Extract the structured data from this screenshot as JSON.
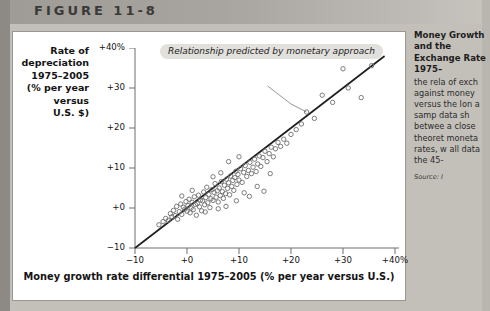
{
  "figure": {
    "label": "FIGURE 11-8"
  },
  "chart_data": {
    "type": "scatter",
    "title": "",
    "xlabel": "Money growth rate differential 1975–2005 (% per year versus U.S.)",
    "ylabel": "Rate of depreciation 1975–2005 (% per year versus U.S. $)",
    "xlim": [
      -10,
      40
    ],
    "ylim": [
      -10,
      40
    ],
    "xticks": [
      "-10",
      "+0",
      "+10",
      "+20",
      "+30",
      "+40%"
    ],
    "yticks": [
      "+40%",
      "+30",
      "+20",
      "+10",
      "+0",
      "-10"
    ],
    "xtick_values": [
      -10,
      0,
      10,
      20,
      30,
      40
    ],
    "ytick_values": [
      40,
      30,
      20,
      10,
      0,
      -10
    ],
    "grid": false,
    "legend": "none",
    "annotation": {
      "text": "Relationship predicted by monetary approach",
      "points_to_x": 23.0,
      "points_to_y": 24.0
    },
    "reference_line": {
      "name": "45-degree line",
      "slope": 1,
      "intercept": 0,
      "from": [
        -10,
        -10
      ],
      "to": [
        38,
        38
      ]
    },
    "marker": {
      "shape": "open-circle",
      "size": 4,
      "color": "#6e6e6e"
    },
    "points": [
      [
        -5.4,
        -4.2
      ],
      [
        -4.6,
        -3.4
      ],
      [
        -4.1,
        -2.6
      ],
      [
        -3.6,
        -3.1
      ],
      [
        -3.2,
        -1.4
      ],
      [
        -2.9,
        -2.2
      ],
      [
        -2.6,
        -0.6
      ],
      [
        -2.3,
        -1.9
      ],
      [
        -2.0,
        0.4
      ],
      [
        -1.8,
        -2.8
      ],
      [
        -1.5,
        -0.9
      ],
      [
        -1.2,
        1.0
      ],
      [
        -1.0,
        -1.6
      ],
      [
        -0.7,
        0.2
      ],
      [
        -0.4,
        -0.3
      ],
      [
        -0.2,
        1.6
      ],
      [
        0.0,
        -0.8
      ],
      [
        0.2,
        0.6
      ],
      [
        0.4,
        2.2
      ],
      [
        0.6,
        -1.2
      ],
      [
        0.8,
        0.0
      ],
      [
        1.0,
        1.4
      ],
      [
        1.2,
        -0.4
      ],
      [
        1.4,
        2.8
      ],
      [
        1.6,
        0.9
      ],
      [
        1.8,
        -1.8
      ],
      [
        2.0,
        1.1
      ],
      [
        2.2,
        3.2
      ],
      [
        2.4,
        0.3
      ],
      [
        2.6,
        2.0
      ],
      [
        2.8,
        -0.7
      ],
      [
        3.0,
        1.8
      ],
      [
        3.2,
        4.0
      ],
      [
        3.4,
        0.8
      ],
      [
        3.6,
        2.6
      ],
      [
        3.8,
        5.2
      ],
      [
        4.0,
        1.3
      ],
      [
        4.2,
        3.4
      ],
      [
        4.4,
        0.1
      ],
      [
        4.6,
        2.3
      ],
      [
        4.8,
        4.6
      ],
      [
        5.0,
        1.9
      ],
      [
        5.2,
        3.9
      ],
      [
        5.4,
        6.1
      ],
      [
        5.6,
        2.7
      ],
      [
        5.8,
        4.3
      ],
      [
        6.0,
        1.5
      ],
      [
        6.2,
        5.0
      ],
      [
        6.4,
        3.1
      ],
      [
        6.6,
        6.6
      ],
      [
        6.8,
        4.1
      ],
      [
        7.0,
        2.4
      ],
      [
        7.2,
        5.7
      ],
      [
        7.4,
        3.6
      ],
      [
        7.6,
        7.2
      ],
      [
        7.8,
        4.9
      ],
      [
        8.0,
        6.3
      ],
      [
        8.2,
        3.3
      ],
      [
        8.4,
        8.0
      ],
      [
        8.6,
        5.4
      ],
      [
        8.8,
        6.9
      ],
      [
        9.0,
        4.4
      ],
      [
        9.2,
        7.6
      ],
      [
        9.4,
        9.2
      ],
      [
        9.6,
        5.9
      ],
      [
        9.8,
        8.4
      ],
      [
        10.0,
        7.0
      ],
      [
        10.3,
        9.8
      ],
      [
        10.6,
        6.4
      ],
      [
        10.9,
        8.9
      ],
      [
        11.2,
        10.6
      ],
      [
        11.5,
        7.9
      ],
      [
        11.8,
        9.4
      ],
      [
        12.1,
        11.4
      ],
      [
        12.4,
        8.6
      ],
      [
        12.7,
        10.2
      ],
      [
        13.0,
        12.2
      ],
      [
        13.3,
        9.1
      ],
      [
        13.6,
        11.0
      ],
      [
        13.9,
        13.0
      ],
      [
        14.2,
        10.4
      ],
      [
        14.6,
        12.6
      ],
      [
        15.0,
        14.2
      ],
      [
        15.4,
        11.6
      ],
      [
        15.8,
        13.6
      ],
      [
        16.2,
        15.2
      ],
      [
        16.6,
        12.8
      ],
      [
        17.0,
        14.8
      ],
      [
        17.5,
        16.4
      ],
      [
        18.0,
        15.4
      ],
      [
        18.6,
        17.2
      ],
      [
        19.2,
        16.2
      ],
      [
        20.0,
        18.4
      ],
      [
        21.0,
        19.6
      ],
      [
        22.0,
        21.0
      ],
      [
        23.0,
        24.0
      ],
      [
        24.5,
        22.4
      ],
      [
        26.0,
        28.2
      ],
      [
        28.0,
        26.4
      ],
      [
        30.0,
        34.8
      ],
      [
        31.0,
        30.0
      ],
      [
        33.5,
        27.6
      ],
      [
        35.5,
        35.6
      ],
      [
        3.5,
        -1.0
      ],
      [
        6.0,
        -0.2
      ],
      [
        7.5,
        0.4
      ],
      [
        9.5,
        1.8
      ],
      [
        12.0,
        2.9
      ],
      [
        14.8,
        4.2
      ],
      [
        8.0,
        11.6
      ],
      [
        10.0,
        12.8
      ],
      [
        5.0,
        7.8
      ],
      [
        1.0,
        4.4
      ],
      [
        -1.0,
        3.0
      ],
      [
        13.5,
        5.4
      ],
      [
        16.0,
        8.6
      ],
      [
        11.0,
        3.8
      ],
      [
        6.5,
        8.8
      ]
    ]
  },
  "sidebar": {
    "heading": "Money Growth and the Exchange Rate 1975–",
    "body": "the rela of exch against money versus the lon a samp data sh betwee a close theoret moneta rates, w all data the 45-",
    "source": "Source: I"
  }
}
